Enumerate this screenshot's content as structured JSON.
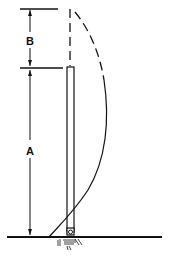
{
  "diagram": {
    "labels": {
      "top_segment": "B",
      "bottom_segment": "A"
    },
    "colors": {
      "stroke": "#111111",
      "background": "#ffffff"
    }
  }
}
